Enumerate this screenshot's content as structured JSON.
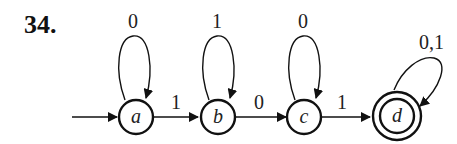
{
  "problem_number": "34.",
  "automaton": {
    "start_state": "a",
    "accept_states": [
      "d"
    ],
    "states": [
      {
        "id": "a",
        "label": "a",
        "self_loop": "0"
      },
      {
        "id": "b",
        "label": "b",
        "self_loop": "1"
      },
      {
        "id": "c",
        "label": "c",
        "self_loop": "0"
      },
      {
        "id": "d",
        "label": "d",
        "self_loop": "0,1"
      }
    ],
    "transitions": [
      {
        "from": "a",
        "to": "b",
        "label": "1"
      },
      {
        "from": "b",
        "to": "c",
        "label": "0"
      },
      {
        "from": "c",
        "to": "d",
        "label": "1"
      }
    ]
  }
}
